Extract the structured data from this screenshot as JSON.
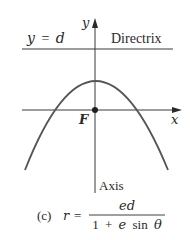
{
  "diagram": {
    "type": "conic-section-polar",
    "labels": {
      "y_axis": "y",
      "x_axis": "x",
      "directrix_equation_lhs": "y",
      "directrix_equation_eq": "=",
      "directrix_equation_rhs": "d",
      "directrix_name": "Directrix",
      "focus": "F",
      "axis": "Axis"
    },
    "caption": {
      "part": "(c)",
      "lhs": "r",
      "eq": "=",
      "numerator": "ed",
      "denominator_one": "1",
      "denominator_plus": "+",
      "denominator_e": "e",
      "denominator_sin": "sin",
      "denominator_theta": "θ"
    },
    "colors": {
      "stroke": "#3a3a3a",
      "curve": "#555555",
      "text": "#2a2a2a",
      "background": "#ffffff"
    }
  }
}
